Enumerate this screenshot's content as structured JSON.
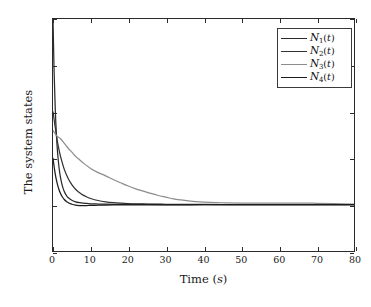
{
  "chart_data": {
    "type": "line",
    "title": "",
    "xlabel": "Time (s)",
    "ylabel": "The system states",
    "xlim": [
      0,
      80
    ],
    "ylim": [
      -5,
      20
    ],
    "xticks": [
      0,
      10,
      20,
      30,
      40,
      50,
      60,
      70,
      80
    ],
    "yticks": [
      -5,
      0,
      5,
      10,
      15,
      20
    ],
    "grid": false,
    "legend_position": "top-right",
    "series": [
      {
        "name": "N1(t)",
        "label_base": "N",
        "label_sub": "1",
        "label_arg": "(t)",
        "color": "#2a2a2a",
        "initial_value": 20,
        "final_value": 0,
        "x": [
          0,
          0.3,
          0.6,
          0.9,
          1.2,
          1.6,
          2,
          2.5,
          3,
          3.5,
          4,
          5,
          6,
          7,
          8,
          9,
          10,
          12,
          14,
          16,
          18,
          20,
          25,
          30,
          35,
          40,
          50,
          60,
          70,
          80
        ],
        "y": [
          20,
          14.2,
          10.3,
          7.6,
          5.7,
          4.0,
          2.9,
          2.0,
          1.42,
          1.02,
          0.76,
          0.46,
          0.3,
          0.21,
          0.15,
          0.12,
          0.09,
          0.06,
          0.04,
          0.03,
          0.025,
          0.02,
          0.012,
          0.008,
          0.005,
          0.004,
          0.002,
          0.001,
          0.001,
          0
        ]
      },
      {
        "name": "N2(t)",
        "label_base": "N",
        "label_sub": "2",
        "label_arg": "(t)",
        "color": "#323232",
        "initial_value": 10,
        "final_value": 0,
        "x": [
          0,
          0.5,
          1,
          1.5,
          2,
          3,
          4,
          5,
          6,
          7,
          8,
          9,
          10,
          12,
          14,
          16,
          18,
          20,
          22,
          25,
          28,
          30,
          35,
          40,
          50,
          60,
          70,
          80
        ],
        "y": [
          10,
          8.6,
          7.2,
          6.1,
          5.2,
          3.8,
          2.85,
          2.15,
          1.65,
          1.3,
          1.02,
          0.82,
          0.66,
          0.44,
          0.3,
          0.21,
          0.15,
          0.11,
          0.085,
          0.06,
          0.045,
          0.035,
          0.02,
          0.014,
          0.006,
          0.003,
          0.002,
          0
        ]
      },
      {
        "name": "N3(t)",
        "label_base": "N",
        "label_sub": "3",
        "label_arg": "(t)",
        "color": "#8c8c8c",
        "initial_value": 8,
        "final_value": 0,
        "x": [
          0,
          1,
          2,
          3,
          4,
          5,
          6,
          7,
          8,
          10,
          12,
          14,
          16,
          18,
          20,
          22,
          24,
          26,
          28,
          30,
          32,
          34,
          36,
          38,
          40,
          45,
          50,
          55,
          60,
          65,
          70,
          75,
          80
        ],
        "y": [
          8,
          7.4,
          7.1,
          6.6,
          6.1,
          5.65,
          5.2,
          4.85,
          4.5,
          3.9,
          3.45,
          3.1,
          2.7,
          2.35,
          2.0,
          1.7,
          1.45,
          1.2,
          0.98,
          0.8,
          0.62,
          0.5,
          0.4,
          0.32,
          0.27,
          0.2,
          0.17,
          0.15,
          0.16,
          0.17,
          0.14,
          0.1,
          0.05
        ]
      },
      {
        "name": "N4(t)",
        "label_base": "N",
        "label_sub": "4",
        "label_arg": "(t)",
        "color": "#1c1c1c",
        "initial_value": 5,
        "final_value": 0,
        "x": [
          0,
          0.4,
          0.8,
          1.2,
          1.6,
          2,
          2.5,
          3,
          3.5,
          4,
          4.5,
          5,
          6,
          7,
          8,
          9,
          10,
          12,
          14,
          16,
          18,
          20,
          25,
          30,
          40,
          50,
          60,
          70,
          80
        ],
        "y": [
          5,
          3.8,
          2.85,
          2.15,
          1.6,
          1.2,
          0.82,
          0.55,
          0.36,
          0.22,
          0.12,
          0.04,
          -0.06,
          -0.1,
          -0.11,
          -0.1,
          -0.09,
          -0.07,
          -0.05,
          -0.04,
          -0.03,
          -0.03,
          -0.02,
          -0.02,
          -0.015,
          -0.01,
          -0.01,
          -0.005,
          0
        ]
      }
    ]
  },
  "axes": {
    "x_title_text": "Time (",
    "x_title_unit": "s",
    "x_title_close": ")",
    "y_title": "The system states",
    "xtick_labels": [
      "0",
      "10",
      "20",
      "30",
      "40",
      "50",
      "60",
      "70",
      "80"
    ],
    "ytick_labels": [
      "20",
      "15",
      "10",
      "5",
      "0",
      "-5"
    ]
  },
  "legend": {
    "items": [
      {
        "base": "N",
        "sub": "1",
        "arg": "(t)",
        "color": "#2a2a2a"
      },
      {
        "base": "N",
        "sub": "2",
        "arg": "(t)",
        "color": "#323232"
      },
      {
        "base": "N",
        "sub": "3",
        "arg": "(t)",
        "color": "#8c8c8c"
      },
      {
        "base": "N",
        "sub": "4",
        "arg": "(t)",
        "color": "#1c1c1c"
      }
    ]
  },
  "colors": {
    "axis": "#2b2b2b",
    "background": "#ffffff",
    "text": "#1a1a1a"
  }
}
